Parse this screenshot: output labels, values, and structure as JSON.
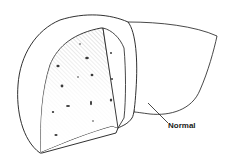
{
  "figure": {
    "label": "Normal",
    "colors": {
      "line": "#1a1a1a",
      "fill": "#ffffff",
      "hatch": "#9a9a9a",
      "spots": "#3a3a3a"
    }
  }
}
